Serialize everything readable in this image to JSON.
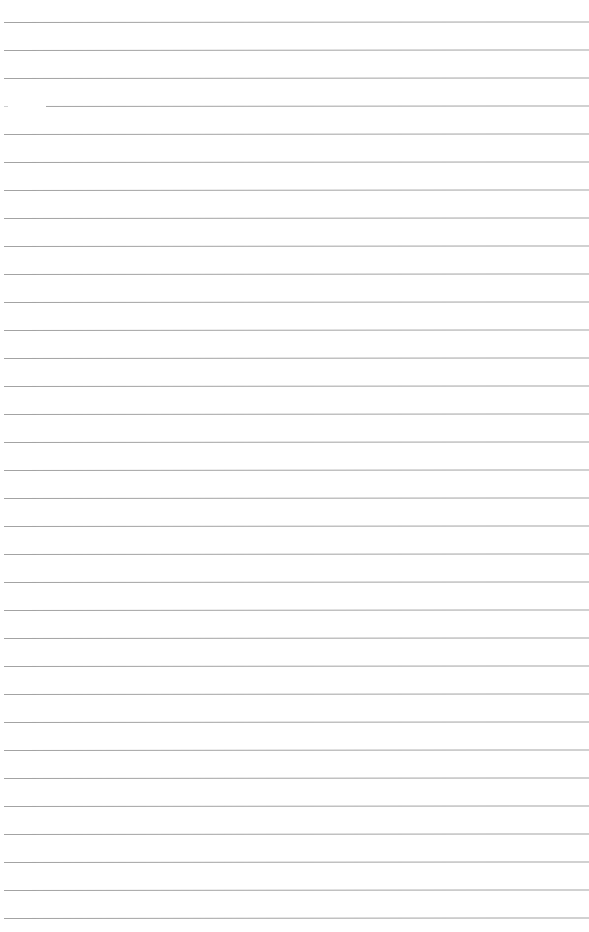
{
  "page": {
    "type": "blank lined sheet",
    "background_color": "#ffffff",
    "rule_color": "#a3a3a3",
    "rule_count": 33,
    "first_rule_y": 22,
    "rule_spacing": 28,
    "rule_left_x": 4
  }
}
